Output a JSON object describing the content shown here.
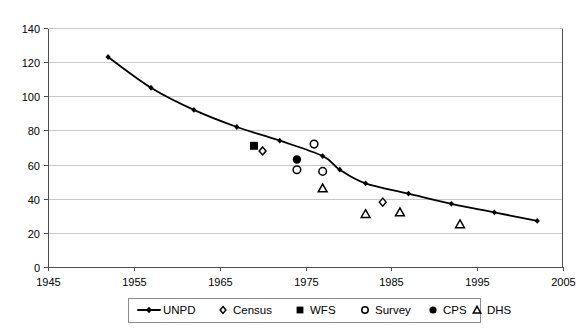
{
  "chart_data": {
    "type": "scatter",
    "title": "",
    "subtitle": "",
    "xlabel": "",
    "ylabel": "",
    "xlim": [
      1945,
      2005
    ],
    "ylim": [
      0,
      140
    ],
    "xticks": [
      1945,
      1955,
      1965,
      1975,
      1985,
      1995,
      2005
    ],
    "xtick_labels": [
      "1945",
      "1955",
      "1965",
      "1975",
      "1985",
      "1995",
      "2005"
    ],
    "yticks": [
      0,
      20,
      40,
      60,
      80,
      100,
      120,
      140
    ],
    "ytick_labels": [
      "0",
      "20",
      "40",
      "60",
      "80",
      "100",
      "120",
      "140"
    ],
    "grid": "horizontal",
    "legend_position": "bottom",
    "series": [
      {
        "name": "UNPD",
        "marker": "line-with-small-filled-diamond",
        "color": "#000000",
        "points": [
          {
            "x": 1952,
            "y": 123
          },
          {
            "x": 1957,
            "y": 105
          },
          {
            "x": 1962,
            "y": 92
          },
          {
            "x": 1967,
            "y": 82
          },
          {
            "x": 1972,
            "y": 74
          },
          {
            "x": 1977,
            "y": 65
          },
          {
            "x": 1979,
            "y": 57
          },
          {
            "x": 1982,
            "y": 49
          },
          {
            "x": 1987,
            "y": 43
          },
          {
            "x": 1992,
            "y": 37
          },
          {
            "x": 1997,
            "y": 32
          },
          {
            "x": 2002,
            "y": 27
          }
        ]
      },
      {
        "name": "Census",
        "marker": "open-diamond",
        "color": "#000000",
        "points": [
          {
            "x": 1970,
            "y": 68
          },
          {
            "x": 1984,
            "y": 38
          }
        ]
      },
      {
        "name": "WFS",
        "marker": "filled-square",
        "color": "#000000",
        "points": [
          {
            "x": 1969,
            "y": 71
          }
        ]
      },
      {
        "name": "Survey",
        "marker": "open-circle",
        "color": "#000000",
        "points": [
          {
            "x": 1974,
            "y": 57
          },
          {
            "x": 1976,
            "y": 72
          },
          {
            "x": 1977,
            "y": 56
          }
        ]
      },
      {
        "name": "CPS",
        "marker": "filled-circle",
        "color": "#000000",
        "points": [
          {
            "x": 1974,
            "y": 63
          }
        ]
      },
      {
        "name": "DHS",
        "marker": "open-triangle",
        "color": "#000000",
        "points": [
          {
            "x": 1977,
            "y": 46
          },
          {
            "x": 1982,
            "y": 31
          },
          {
            "x": 1986,
            "y": 32
          },
          {
            "x": 1993,
            "y": 25
          }
        ]
      }
    ]
  },
  "legend": {
    "items": [
      {
        "label": "UNPD",
        "marker": "line-with-small-filled-diamond"
      },
      {
        "label": "Census",
        "marker": "open-diamond"
      },
      {
        "label": "WFS",
        "marker": "filled-square"
      },
      {
        "label": "Survey",
        "marker": "open-circle"
      },
      {
        "label": "CPS",
        "marker": "filled-circle"
      },
      {
        "label": "DHS",
        "marker": "open-triangle"
      }
    ]
  },
  "colors": {
    "background": "#ffffff",
    "ink": "#000000",
    "gridline": "#c8c8c8",
    "axis": "#4d4d4d"
  }
}
